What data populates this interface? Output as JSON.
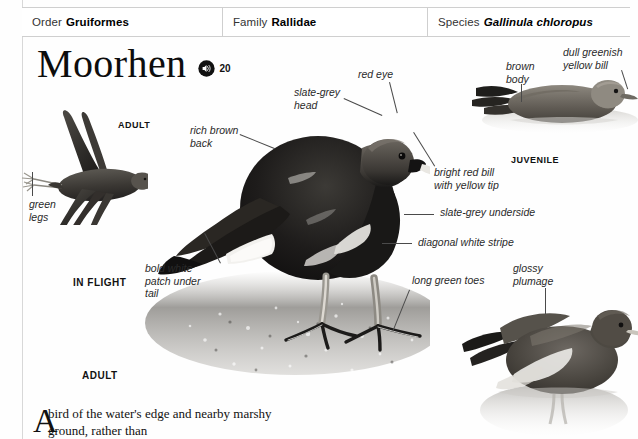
{
  "header": {
    "order": {
      "label": "Order",
      "value": "Gruiformes"
    },
    "family": {
      "label": "Family",
      "value": "Rallidae"
    },
    "species": {
      "label": "Species",
      "value": "Gallinula chloropus"
    }
  },
  "title": {
    "name": "Moorhen",
    "audio_icon": "speaker-icon",
    "audio_number": "20"
  },
  "captions": {
    "in_flight_adult": "ADULT",
    "in_flight": "IN FLIGHT",
    "juvenile": "JUVENILE",
    "adult": "ADULT"
  },
  "labels": {
    "green_legs": "green\nlegs",
    "rich_brown_back": "rich brown\nback",
    "slate_grey_head": "slate-grey\nhead",
    "red_eye": "red eye",
    "bright_red_bill": "bright red bill\nwith yellow tip",
    "slate_grey_underside": "slate-grey underside",
    "diagonal_white_stripe": "diagonal white stripe",
    "bold_white_patch": "bold white\npatch under\ntail",
    "long_green_toes": "long green toes",
    "brown_body": "brown\nbody",
    "dull_greenish_yellow_bill": "dull greenish\nyellow bill",
    "glossy_plumage": "glossy\nplumage"
  },
  "body": {
    "dropcap": "A",
    "paragraph": "bird of the water's edge and nearby marshy ground, rather than"
  },
  "colors": {
    "ink": "#111111",
    "rule": "#cfcfcf",
    "label": "#2a2a2a",
    "leader": "#4a4a4a"
  }
}
